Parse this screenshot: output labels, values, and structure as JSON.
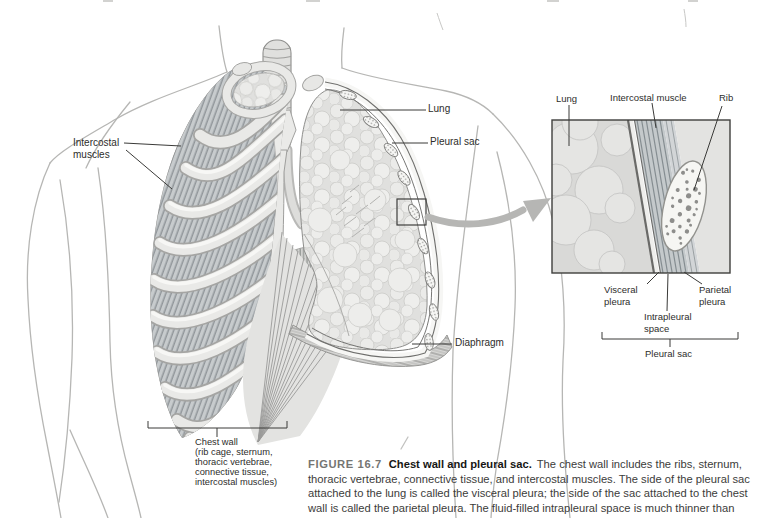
{
  "colors": {
    "paper": "#ffffff",
    "label_ink": "#2d2d2b",
    "caption_ink": "#3c3c3a",
    "figure_number_gray": "#757573",
    "leader_line": "#3a3a38",
    "illustration_gray": "#c9cdcf"
  },
  "main": {
    "labels": {
      "intercostal_line1": "Intercostal",
      "intercostal_line2": "muscles",
      "lung": "Lung",
      "pleural_sac": "Pleural sac",
      "diaphragm": "Diaphragm"
    },
    "chest_wall_label": {
      "line1": "Chest wall",
      "line2": "(rib cage, sternum,",
      "line3": "thoracic vertebrae,",
      "line4": "connective tissue,",
      "line5": "intercostal muscles)"
    }
  },
  "inset": {
    "labels_top": {
      "lung": "Lung",
      "intercostal_muscle": "Intercostal muscle",
      "rib": "Rib"
    },
    "labels_bottom": {
      "visceral_line1": "Visceral",
      "visceral_line2": "pleura",
      "parietal_line1": "Parietal",
      "parietal_line2": "pleura",
      "intrapleural_line1": "Intrapleural",
      "intrapleural_line2": "space",
      "pleural_sac": "Pleural sac"
    }
  },
  "caption": {
    "number": "FIGURE 16.7",
    "title": "Chest wall and pleural sac.",
    "body": "The chest wall includes the ribs, sternum, thoracic vertebrae, connective tissue, and intercostal muscles. The side of the pleural sac attached to the lung is called the visceral pleura; the side of the sac attached to the chest wall is called the parietal pleura. The fluid-filled intrapleural space is much thinner than"
  }
}
